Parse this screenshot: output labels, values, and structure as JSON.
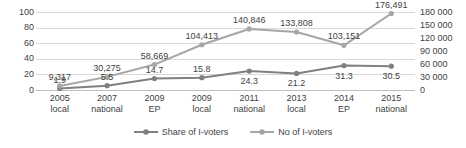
{
  "chart_data": {
    "type": "line",
    "title": "",
    "xlabel": "",
    "categories": [
      {
        "year": "2005",
        "kind": "local"
      },
      {
        "year": "2007",
        "kind": "national"
      },
      {
        "year": "2009",
        "kind": "EP"
      },
      {
        "year": "2009",
        "kind": "local"
      },
      {
        "year": "2011",
        "kind": "national"
      },
      {
        "year": "2013",
        "kind": "local"
      },
      {
        "year": "2014",
        "kind": "EP"
      },
      {
        "year": "2015",
        "kind": "national"
      }
    ],
    "series": [
      {
        "name": "Share of I-voters",
        "axis": "left",
        "color": "#808080",
        "values": [
          1.9,
          5.5,
          14.7,
          15.8,
          24.3,
          21.2,
          31.3,
          30.5
        ],
        "labels": [
          "1.9",
          "5.5",
          "14.7",
          "15.8",
          "24.3",
          "21.2",
          "31.3",
          "30.5"
        ],
        "label_positions": [
          "above",
          "above",
          "above",
          "above",
          "below",
          "below",
          "below",
          "below"
        ]
      },
      {
        "name": "No of I-voters",
        "axis": "right",
        "color": "#a6a6a6",
        "values": [
          9317,
          30275,
          58669,
          104413,
          140846,
          133808,
          103151,
          176491
        ],
        "labels": [
          "9,317",
          "30,275",
          "58,669",
          "104,413",
          "140,846",
          "133,808",
          "103,151",
          "176,491"
        ],
        "label_positions": [
          "above",
          "above",
          "above",
          "above",
          "above",
          "above",
          "above",
          "above"
        ]
      }
    ],
    "left_axis": {
      "label": "",
      "ylim": [
        0,
        100
      ],
      "step": 20,
      "ticks": [
        "0",
        "20",
        "40",
        "60",
        "80",
        "100"
      ]
    },
    "right_axis": {
      "label": "",
      "ylim": [
        0,
        180000
      ],
      "step": 30000,
      "ticks": [
        "0",
        "30 000",
        "60 000",
        "90 000",
        "120 000",
        "150 000",
        "180 000"
      ]
    },
    "grid": true,
    "legend": {
      "position": "bottom",
      "entries": [
        {
          "label": "Share of I-voters",
          "color": "#808080"
        },
        {
          "label": "No of I-voters",
          "color": "#a6a6a6"
        }
      ]
    },
    "colors": {
      "share_series": "#808080",
      "number_series": "#a6a6a6",
      "gridline": "#d9d9d9",
      "axis_line": "#bfbfbf",
      "text": "#3f3f3f",
      "background": "#ffffff"
    }
  }
}
